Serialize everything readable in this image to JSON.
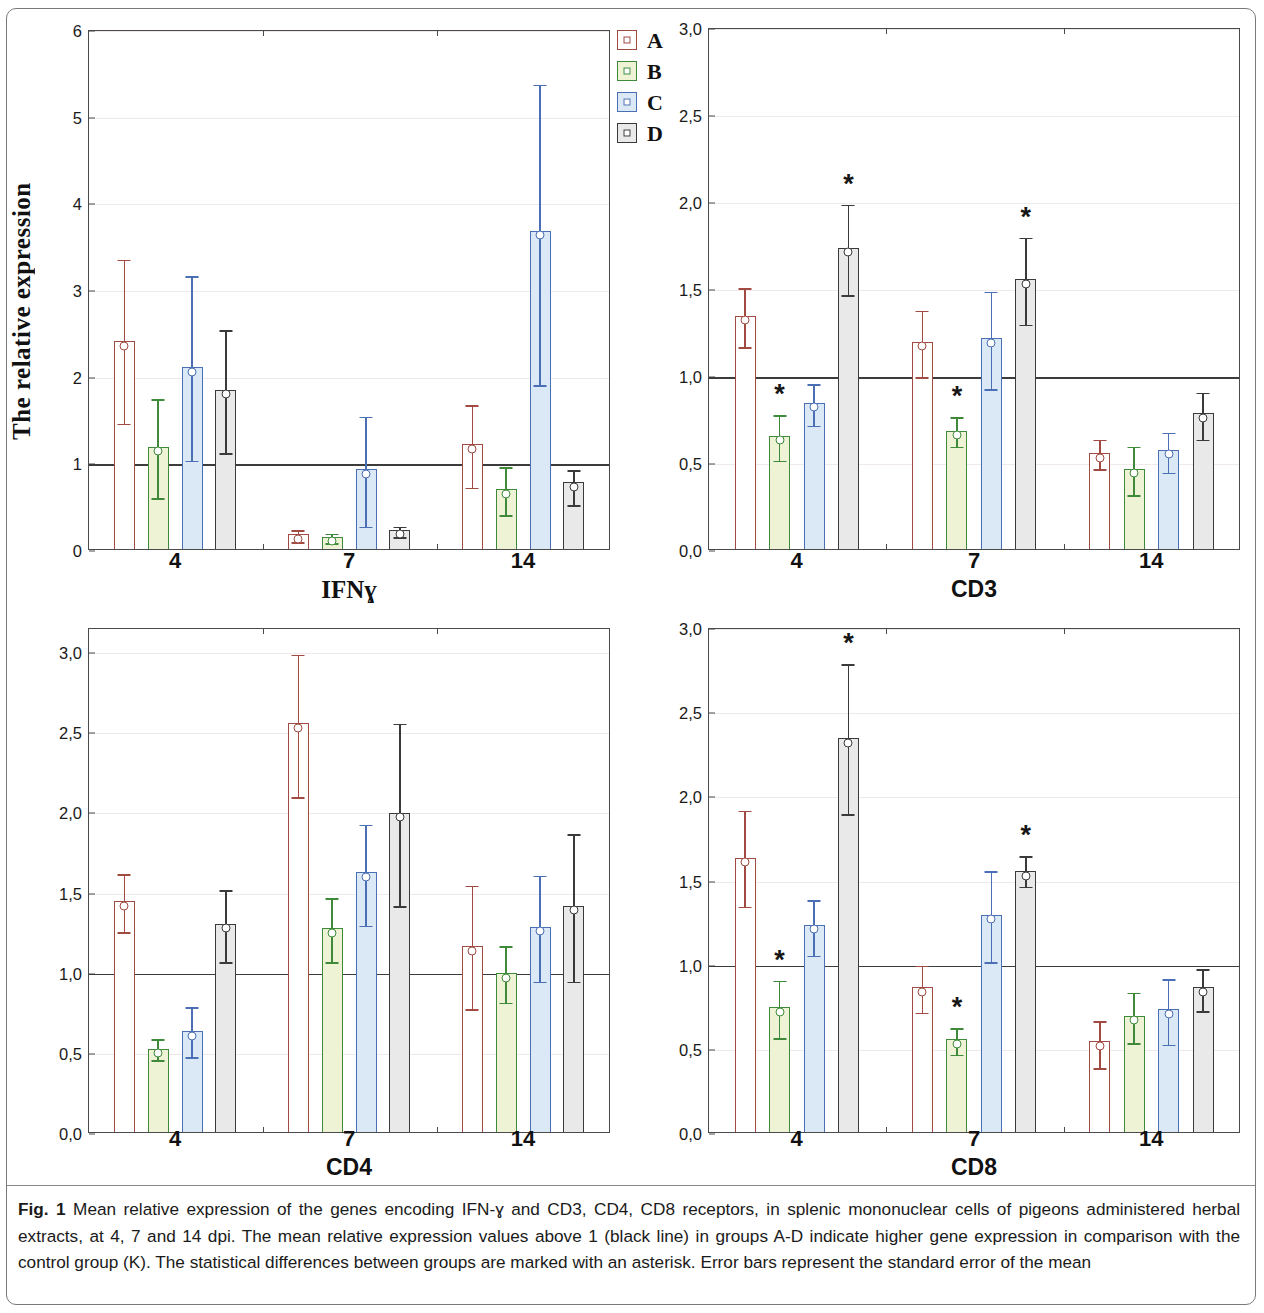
{
  "figure": {
    "y_axis_title": "The relative expression",
    "caption_label": "Fig. 1",
    "caption_text": "Mean relative expression of the genes encoding IFN-ɣ and CD3, CD4, CD8 receptors, in splenic mononuclear cells of pigeons administered herbal extracts, at 4, 7 and 14 dpi. The mean relative expression values above 1 (black line) in groups A-D indicate higher gene expression in comparison with the control group (K). The statistical differences between groups are marked with an asterisk. Error bars represent the standard error of the mean"
  },
  "legend": {
    "position": "top-right",
    "items": [
      {
        "label": "A",
        "color": "#a14a42",
        "fill": "#ffffff"
      },
      {
        "label": "B",
        "color": "#3f8a3a",
        "fill": "#eef3d6"
      },
      {
        "label": "C",
        "color": "#4a6fb5",
        "fill": "#dbe9f6"
      },
      {
        "label": "D",
        "color": "#3a3a3a",
        "fill": "#e9e9e9"
      }
    ]
  },
  "chart_data": [
    {
      "id": "ifng",
      "type": "bar",
      "title": "IFNɣ",
      "xlabel": "",
      "ylabel": "The relative expression",
      "categories": [
        "4",
        "7",
        "14"
      ],
      "ylim": [
        0,
        6
      ],
      "yticks": [
        0,
        1,
        2,
        3,
        4,
        5,
        6
      ],
      "ytick_labels": [
        "0",
        "1",
        "2",
        "3",
        "4",
        "5",
        "6"
      ],
      "reference_line": 1,
      "grid": true,
      "series": [
        {
          "name": "A",
          "values": [
            2.4,
            0.17,
            1.21
          ],
          "err_low": [
            1.47,
            0.1,
            0.73
          ],
          "err_high": [
            3.36,
            0.24,
            1.68
          ],
          "stars": [
            false,
            false,
            false
          ]
        },
        {
          "name": "B",
          "values": [
            1.18,
            0.14,
            0.69
          ],
          "err_low": [
            0.61,
            0.09,
            0.41
          ],
          "err_high": [
            1.75,
            0.2,
            0.97
          ],
          "stars": [
            false,
            false,
            false
          ]
        },
        {
          "name": "C",
          "values": [
            2.1,
            0.92,
            3.67
          ],
          "err_low": [
            1.04,
            0.28,
            1.91
          ],
          "err_high": [
            3.17,
            1.55,
            5.38
          ],
          "stars": [
            false,
            false,
            false
          ]
        },
        {
          "name": "D",
          "values": [
            1.84,
            0.22,
            0.77
          ],
          "err_low": [
            1.13,
            0.16,
            0.53
          ],
          "err_high": [
            2.55,
            0.28,
            0.93
          ],
          "stars": [
            false,
            false,
            false
          ]
        }
      ]
    },
    {
      "id": "cd3",
      "type": "bar",
      "title": "CD3",
      "xlabel": "",
      "ylabel": "The relative expression",
      "categories": [
        "4",
        "7",
        "14"
      ],
      "ylim": [
        0,
        3.0
      ],
      "yticks": [
        0.0,
        0.5,
        1.0,
        1.5,
        2.0,
        2.5,
        3.0
      ],
      "ytick_labels": [
        "0,0",
        "0,5",
        "1,0",
        "1,5",
        "2,0",
        "2,5",
        "3,0"
      ],
      "reference_line": 1.0,
      "grid": true,
      "series": [
        {
          "name": "A",
          "values": [
            1.34,
            1.19,
            0.55
          ],
          "err_low": [
            1.17,
            1.0,
            0.47
          ],
          "err_high": [
            1.51,
            1.38,
            0.64
          ],
          "stars": [
            false,
            false,
            false
          ]
        },
        {
          "name": "B",
          "values": [
            0.65,
            0.68,
            0.46
          ],
          "err_low": [
            0.52,
            0.6,
            0.32
          ],
          "err_high": [
            0.78,
            0.77,
            0.6
          ],
          "stars": [
            true,
            true,
            false
          ]
        },
        {
          "name": "C",
          "values": [
            0.84,
            1.21,
            0.57
          ],
          "err_low": [
            0.72,
            0.93,
            0.45
          ],
          "err_high": [
            0.96,
            1.49,
            0.68
          ],
          "stars": [
            false,
            false,
            false
          ]
        },
        {
          "name": "D",
          "values": [
            1.73,
            1.55,
            0.78
          ],
          "err_low": [
            1.47,
            1.3,
            0.64
          ],
          "err_high": [
            1.99,
            1.8,
            0.91
          ],
          "stars": [
            true,
            true,
            false
          ]
        }
      ]
    },
    {
      "id": "cd4",
      "type": "bar",
      "title": "CD4",
      "xlabel": "",
      "ylabel": "The relative expression",
      "categories": [
        "4",
        "7",
        "14"
      ],
      "ylim": [
        0,
        3.15
      ],
      "yticks": [
        0.0,
        0.5,
        1.0,
        1.5,
        2.0,
        2.5,
        3.0
      ],
      "ytick_labels": [
        "0,0",
        "0,5",
        "1,0",
        "1,5",
        "2,0",
        "2,5",
        "3,0"
      ],
      "reference_line": 1.0,
      "grid": true,
      "series": [
        {
          "name": "A",
          "values": [
            1.44,
            2.55,
            1.16
          ],
          "err_low": [
            1.26,
            2.1,
            0.78
          ],
          "err_high": [
            1.62,
            2.99,
            1.55
          ],
          "stars": [
            false,
            false,
            false
          ]
        },
        {
          "name": "B",
          "values": [
            0.52,
            1.27,
            0.99
          ],
          "err_low": [
            0.46,
            1.07,
            0.82
          ],
          "err_high": [
            0.59,
            1.47,
            1.17
          ],
          "stars": [
            false,
            false,
            false
          ]
        },
        {
          "name": "C",
          "values": [
            0.63,
            1.62,
            1.28
          ],
          "err_low": [
            0.48,
            1.3,
            0.95
          ],
          "err_high": [
            0.79,
            1.93,
            1.61
          ],
          "stars": [
            false,
            false,
            false
          ]
        },
        {
          "name": "D",
          "values": [
            1.3,
            1.99,
            1.41
          ],
          "err_low": [
            1.07,
            1.42,
            0.95
          ],
          "err_high": [
            1.52,
            2.56,
            1.87
          ],
          "stars": [
            false,
            false,
            false
          ]
        }
      ]
    },
    {
      "id": "cd8",
      "type": "bar",
      "title": "CD8",
      "xlabel": "",
      "ylabel": "The relative expression",
      "categories": [
        "4",
        "7",
        "14"
      ],
      "ylim": [
        0,
        3.0
      ],
      "yticks": [
        0.0,
        0.5,
        1.0,
        1.5,
        2.0,
        2.5,
        3.0
      ],
      "ytick_labels": [
        "0,0",
        "0,5",
        "1,0",
        "1,5",
        "2,0",
        "2,5",
        "3,0"
      ],
      "reference_line": 1.0,
      "grid": true,
      "series": [
        {
          "name": "A",
          "values": [
            1.63,
            0.86,
            0.54
          ],
          "err_low": [
            1.35,
            0.72,
            0.39
          ],
          "err_high": [
            1.92,
            1.0,
            0.67
          ],
          "stars": [
            false,
            false,
            false
          ]
        },
        {
          "name": "B",
          "values": [
            0.74,
            0.55,
            0.69
          ],
          "err_low": [
            0.57,
            0.47,
            0.54
          ],
          "err_high": [
            0.91,
            0.63,
            0.84
          ],
          "stars": [
            true,
            true,
            false
          ]
        },
        {
          "name": "C",
          "values": [
            1.23,
            1.29,
            0.73
          ],
          "err_low": [
            1.06,
            1.02,
            0.53
          ],
          "err_high": [
            1.39,
            1.56,
            0.92
          ],
          "stars": [
            false,
            false,
            false
          ]
        },
        {
          "name": "D",
          "values": [
            2.34,
            1.55,
            0.86
          ],
          "err_low": [
            1.9,
            1.47,
            0.73
          ],
          "err_high": [
            2.79,
            1.65,
            0.98
          ],
          "stars": [
            true,
            true,
            false
          ]
        }
      ]
    }
  ]
}
